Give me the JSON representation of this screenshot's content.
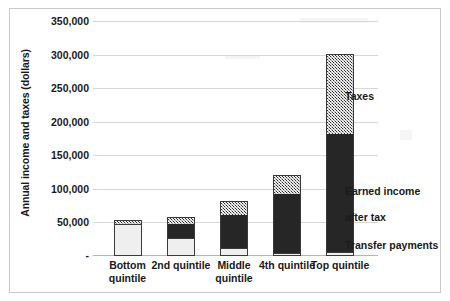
{
  "chart_data": {
    "type": "bar",
    "title": "",
    "subtitle": "",
    "stacked": true,
    "xlabel": "",
    "ylabel": "Annual income and taxes (dollars)",
    "categories": [
      "Bottom quintile",
      "2nd quintile",
      "Middle quintile",
      "4th quintile",
      "Top quintile"
    ],
    "ylim": [
      0,
      350000
    ],
    "ytick_labels": [
      "350,000",
      "300,000",
      "250,000",
      "200,000",
      "150,000",
      "100,000",
      "50,000",
      "-"
    ],
    "ytick_values": [
      350000,
      300000,
      250000,
      200000,
      150000,
      100000,
      50000,
      0
    ],
    "grid": true,
    "legend_position": "right-inline-annotations",
    "series": [
      {
        "name": "Transfer payments",
        "fill": "light-gray-solid",
        "color": "#efefef",
        "values": [
          47000,
          27000,
          12000,
          5000,
          6000
        ]
      },
      {
        "name": "Earned income after tax",
        "fill": "black-solid",
        "color": "#262626",
        "values": [
          0,
          21000,
          49000,
          88000,
          175000
        ]
      },
      {
        "name": "Taxes",
        "fill": "gray-hatched",
        "color": "#a6a6a6",
        "values": [
          6000,
          10000,
          21000,
          28000,
          120000
        ]
      }
    ],
    "totals": [
      53000,
      58000,
      82000,
      121000,
      301000
    ],
    "annotations": [
      {
        "text": "Taxes",
        "series": "Taxes"
      },
      {
        "text": "Earned income\nafter tax",
        "series": "Earned income after tax"
      },
      {
        "text": "Transfer payments",
        "series": "Transfer payments"
      }
    ]
  },
  "axis": {
    "y_title": "Annual income and taxes (dollars)",
    "y_ticks": [
      {
        "label": "350,000",
        "value": 350000
      },
      {
        "label": "300,000",
        "value": 300000
      },
      {
        "label": "250,000",
        "value": 250000
      },
      {
        "label": "200,000",
        "value": 200000
      },
      {
        "label": "150,000",
        "value": 150000
      },
      {
        "label": "100,000",
        "value": 100000
      },
      {
        "label": "50,000",
        "value": 50000
      },
      {
        "label": "-",
        "value": 0
      }
    ]
  },
  "x_categories": [
    {
      "line1": "Bottom",
      "line2": "quintile"
    },
    {
      "line1": "2nd quintile",
      "line2": ""
    },
    {
      "line1": "Middle",
      "line2": "quintile"
    },
    {
      "line1": "4th quintile",
      "line2": ""
    },
    {
      "line1": "Top quintile",
      "line2": ""
    }
  ],
  "annotations": {
    "taxes": "Taxes",
    "earned_line1": "Earned income",
    "earned_line2": "after tax",
    "transfer": "Transfer payments"
  },
  "colors": {
    "taxes": "#a6a6a6",
    "earned": "#262626",
    "transfer": "#efefef",
    "grid": "#d7d7d7",
    "frame": "#c9c9c9",
    "text": "#1a1a1a"
  }
}
